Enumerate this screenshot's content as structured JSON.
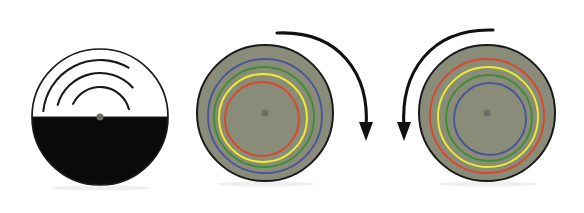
{
  "figure": {
    "caption": "",
    "background_color": "#ffffff",
    "width": 584,
    "height": 213
  },
  "palette": {
    "outline": "#1a1a1a",
    "disc_gray": "#8a8c7a",
    "disc_gray_edge": "#7e8070",
    "black_fill": "#0a0a0a",
    "white_fill": "#ffffff",
    "hub_dot": "#6d6d66",
    "ring_blue": "#4a5596",
    "ring_green": "#3f8c34",
    "ring_yellow": "#eded2e",
    "ring_red": "#d9482a",
    "arrow_black": "#111111",
    "shadow": "#e9e9e9"
  },
  "panels": [
    {
      "id": "panel-1",
      "label": "split-disc-with-spiral-arcs",
      "center": {
        "x": 100,
        "y": 117
      },
      "radius": 68,
      "fill_top": "#ffffff",
      "fill_bottom": "#0a0a0a",
      "divider_y": 117,
      "hub_dot_radius": 3.5,
      "arcs": [
        {
          "name": "arc-outer",
          "radius": 57,
          "start_deg": 186,
          "end_deg": 300
        },
        {
          "name": "arc-middle",
          "radius": 44,
          "start_deg": 196,
          "end_deg": 318
        },
        {
          "name": "arc-inner",
          "radius": 30,
          "start_deg": 206,
          "end_deg": 345
        }
      ],
      "arrow": null
    },
    {
      "id": "panel-2",
      "label": "gray-disc-rings-blue-outermost",
      "center": {
        "x": 265,
        "y": 113
      },
      "radius": 68,
      "fill": "#8a8c7a",
      "hub_dot_radius": 3.5,
      "rings": [
        {
          "name": "ring-blue",
          "color": "#4a5596",
          "radius": 57,
          "offset_x": 0,
          "offset_y": 3
        },
        {
          "name": "ring-green",
          "color": "#3f8c34",
          "radius": 50,
          "offset_x": -1,
          "offset_y": 4
        },
        {
          "name": "ring-yellow",
          "color": "#eded2e",
          "radius": 44,
          "offset_x": -2,
          "offset_y": 5
        },
        {
          "name": "ring-red",
          "color": "#d9482a",
          "radius": 37,
          "offset_x": -3,
          "offset_y": 6
        }
      ],
      "arrow": {
        "name": "rotation-arrow-clockwise",
        "direction": "clockwise",
        "start": {
          "x": 277,
          "y": 33
        },
        "end": {
          "x": 366,
          "y": 128
        },
        "control1": {
          "x": 340,
          "y": 30
        },
        "control2": {
          "x": 370,
          "y": 75
        },
        "head_angle_deg": 90
      }
    },
    {
      "id": "panel-3",
      "label": "gray-disc-rings-red-outermost",
      "center": {
        "x": 487,
        "y": 113
      },
      "radius": 68,
      "fill": "#8a8c7a",
      "hub_dot_radius": 3.5,
      "rings": [
        {
          "name": "ring-red",
          "color": "#d9482a",
          "radius": 57,
          "offset_x": 0,
          "offset_y": 3
        },
        {
          "name": "ring-yellow",
          "color": "#eded2e",
          "radius": 50,
          "offset_x": 1,
          "offset_y": 4
        },
        {
          "name": "ring-green",
          "color": "#3f8c34",
          "radius": 43,
          "offset_x": 2,
          "offset_y": 5
        },
        {
          "name": "ring-blue",
          "color": "#4a5596",
          "radius": 36,
          "offset_x": 3,
          "offset_y": 6
        }
      ],
      "arrow": {
        "name": "rotation-arrow-counterclockwise",
        "direction": "counterclockwise",
        "start": {
          "x": 493,
          "y": 30
        },
        "end": {
          "x": 404,
          "y": 128
        },
        "control1": {
          "x": 430,
          "y": 28
        },
        "control2": {
          "x": 400,
          "y": 73
        },
        "head_angle_deg": 90
      }
    }
  ]
}
